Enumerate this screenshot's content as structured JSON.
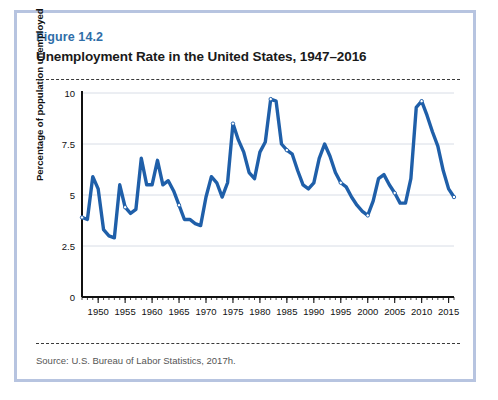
{
  "figure": {
    "number": "Figure 14.2",
    "title": "Unemployment Rate in the United States, 1947–2016",
    "source": "Source: U.S. Bureau of Labor Statistics, 2017h."
  },
  "colors": {
    "line": "#1f5fa9",
    "figure_number": "#2f6ea8",
    "frame": "#b7c4e0",
    "grid": "#d8dde6",
    "axis": "#111111"
  },
  "chart_data": {
    "type": "line",
    "title": "Unemployment Rate in the United States, 1947–2016",
    "xlabel": "",
    "ylabel": "Percentage of population unemployed",
    "xlim": [
      1947,
      2016
    ],
    "ylim": [
      0,
      10
    ],
    "yticks": [
      0,
      2.5,
      5,
      7.5,
      10
    ],
    "ytick_labels": [
      "0",
      "2.5",
      "5",
      "7.5",
      "10"
    ],
    "xticks": [
      1950,
      1955,
      1960,
      1965,
      1970,
      1975,
      1980,
      1985,
      1990,
      1995,
      2000,
      2005,
      2010,
      2015
    ],
    "xtick_labels": [
      "1950",
      "1955",
      "1960",
      "1965",
      "1970",
      "1975",
      "1980",
      "1985",
      "1990",
      "1995",
      "2000",
      "2005",
      "2010",
      "2015"
    ],
    "minor_xticks_every": 1,
    "grid": "horizontal",
    "legend": null,
    "series": [
      {
        "name": "Unemployment rate",
        "color": "#1f5fa9",
        "x": [
          1947,
          1948,
          1949,
          1950,
          1951,
          1952,
          1953,
          1954,
          1955,
          1956,
          1957,
          1958,
          1959,
          1960,
          1961,
          1962,
          1963,
          1964,
          1965,
          1966,
          1967,
          1968,
          1969,
          1970,
          1971,
          1972,
          1973,
          1974,
          1975,
          1976,
          1977,
          1978,
          1979,
          1980,
          1981,
          1982,
          1983,
          1984,
          1985,
          1986,
          1987,
          1988,
          1989,
          1990,
          1991,
          1992,
          1993,
          1994,
          1995,
          1996,
          1997,
          1998,
          1999,
          2000,
          2001,
          2002,
          2003,
          2004,
          2005,
          2006,
          2007,
          2008,
          2009,
          2010,
          2011,
          2012,
          2013,
          2014,
          2015,
          2016
        ],
        "values": [
          3.9,
          3.8,
          5.9,
          5.3,
          3.3,
          3.0,
          2.9,
          5.5,
          4.4,
          4.1,
          4.3,
          6.8,
          5.5,
          5.5,
          6.7,
          5.5,
          5.7,
          5.2,
          4.5,
          3.8,
          3.8,
          3.6,
          3.5,
          4.9,
          5.9,
          5.6,
          4.9,
          5.6,
          8.5,
          7.7,
          7.1,
          6.1,
          5.8,
          7.1,
          7.6,
          9.7,
          9.6,
          7.5,
          7.2,
          7.0,
          6.2,
          5.5,
          5.3,
          5.6,
          6.8,
          7.5,
          6.9,
          6.1,
          5.6,
          5.4,
          4.9,
          4.5,
          4.2,
          4.0,
          4.7,
          5.8,
          6.0,
          5.5,
          5.1,
          4.6,
          4.6,
          5.8,
          9.3,
          9.6,
          8.9,
          8.1,
          7.4,
          6.2,
          5.3,
          4.9
        ]
      }
    ],
    "marker_years": [
      1947,
      1955,
      1965,
      1975,
      1982,
      1985,
      1995,
      2000,
      2005,
      2010,
      2016
    ]
  }
}
